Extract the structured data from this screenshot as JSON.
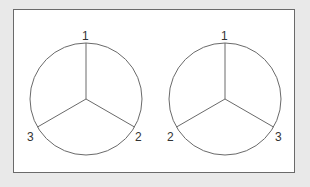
{
  "diagram": {
    "colors": {
      "background": "#e9e9e9",
      "panel": "#ffffff",
      "stroke": "#6a6a6a",
      "text": "#333333"
    },
    "circles": [
      {
        "name": "left",
        "labels": {
          "top": "1",
          "bottom_right": "2",
          "bottom_left": "3"
        }
      },
      {
        "name": "right",
        "labels": {
          "top": "1",
          "bottom_left": "2",
          "bottom_right": "3"
        }
      }
    ]
  }
}
